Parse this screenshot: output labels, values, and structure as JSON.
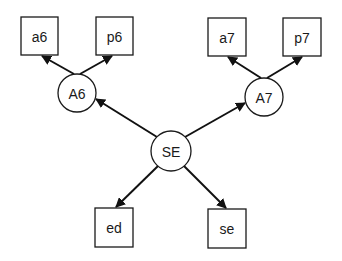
{
  "diagram": {
    "type": "path-diagram",
    "nodes": [
      {
        "id": "SE",
        "label": "SE",
        "shape": "circle"
      },
      {
        "id": "A6",
        "label": "A6",
        "shape": "circle"
      },
      {
        "id": "A7",
        "label": "A7",
        "shape": "circle"
      },
      {
        "id": "a6",
        "label": "a6",
        "shape": "box"
      },
      {
        "id": "p6",
        "label": "p6",
        "shape": "box"
      },
      {
        "id": "a7",
        "label": "a7",
        "shape": "box"
      },
      {
        "id": "p7",
        "label": "p7",
        "shape": "box"
      },
      {
        "id": "ed",
        "label": "ed",
        "shape": "box"
      },
      {
        "id": "se",
        "label": "se",
        "shape": "box"
      }
    ],
    "edges": [
      {
        "from": "SE",
        "to": "A6"
      },
      {
        "from": "SE",
        "to": "A7"
      },
      {
        "from": "SE",
        "to": "ed"
      },
      {
        "from": "SE",
        "to": "se"
      },
      {
        "from": "A6",
        "to": "a6"
      },
      {
        "from": "A6",
        "to": "p6"
      },
      {
        "from": "A7",
        "to": "a7"
      },
      {
        "from": "A7",
        "to": "p7"
      }
    ],
    "colors": {
      "stroke": "#1a1a1a",
      "background": "#ffffff"
    }
  }
}
